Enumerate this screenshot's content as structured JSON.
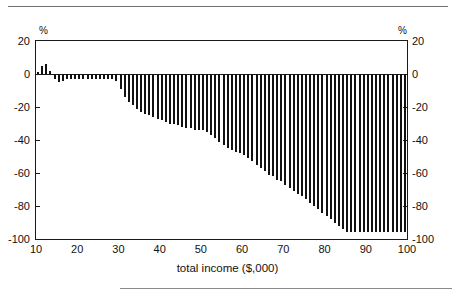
{
  "page": {
    "header_text": "",
    "background": "#ffffff",
    "ink": "#111111"
  },
  "axes": {
    "y_unit_label": "%",
    "y_ticks": [
      20,
      0,
      -20,
      -40,
      -60,
      -80,
      -100
    ],
    "y_tick_labels": [
      "20",
      "0",
      "-20",
      "-40",
      "-60",
      "-80",
      "-100"
    ],
    "x_ticks": [
      10,
      20,
      30,
      40,
      50,
      60,
      70,
      80,
      90,
      100
    ],
    "x_tick_labels": [
      "10",
      "20",
      "30",
      "40",
      "50",
      "60",
      "70",
      "80",
      "90",
      "100"
    ],
    "x_title": "total income ($,000)"
  },
  "chart_data": {
    "type": "bar",
    "title": "",
    "xlabel": "total income ($,000)",
    "ylabel": "%",
    "xlim": [
      10,
      100
    ],
    "ylim": [
      -100,
      20
    ],
    "grid": false,
    "legend": null,
    "bar_color": "#111111",
    "x": [
      10.5,
      11.5,
      12.5,
      13.5,
      14.5,
      15.5,
      16.5,
      17.5,
      18.5,
      19.5,
      20.5,
      21.5,
      22.5,
      23.5,
      24.5,
      25.5,
      26.5,
      27.5,
      28.5,
      29.5,
      30.5,
      31.5,
      32.5,
      33.5,
      34.5,
      35.5,
      36.5,
      37.5,
      38.5,
      39.5,
      40.5,
      41.5,
      42.5,
      43.5,
      44.5,
      45.5,
      46.5,
      47.5,
      48.5,
      49.5,
      50.5,
      51.5,
      52.5,
      53.5,
      54.5,
      55.5,
      56.5,
      57.5,
      58.5,
      59.5,
      60.5,
      61.5,
      62.5,
      63.5,
      64.5,
      65.5,
      66.5,
      67.5,
      68.5,
      69.5,
      70.5,
      71.5,
      72.5,
      73.5,
      74.5,
      75.5,
      76.5,
      77.5,
      78.5,
      79.5,
      80.5,
      81.5,
      82.5,
      83.5,
      84.5,
      85.5,
      86.5,
      87.5,
      88.5,
      89.5,
      90.5,
      91.5,
      92.5,
      93.5,
      94.5,
      95.5,
      96.5,
      97.5,
      98.5,
      99.5
    ],
    "values": [
      1,
      5,
      6,
      2,
      -3,
      -5,
      -4,
      -3,
      -3,
      -3,
      -3,
      -3,
      -3,
      -3,
      -3,
      -3,
      -3,
      -3,
      -3,
      -4,
      -9,
      -14,
      -17,
      -19,
      -21,
      -23,
      -24,
      -25,
      -26,
      -27,
      -28,
      -29,
      -30,
      -30,
      -31,
      -32,
      -33,
      -33,
      -34,
      -34,
      -34,
      -35,
      -37,
      -39,
      -41,
      -43,
      -45,
      -46,
      -47,
      -48,
      -49,
      -51,
      -53,
      -55,
      -57,
      -59,
      -61,
      -62,
      -64,
      -65,
      -67,
      -69,
      -71,
      -73,
      -74,
      -76,
      -78,
      -80,
      -82,
      -84,
      -86,
      -88,
      -90,
      -92,
      -94,
      -96,
      -96,
      -96,
      -96,
      -96,
      -96,
      -96,
      -96,
      -96,
      -96,
      -96,
      -96,
      -96,
      -96,
      -96
    ]
  }
}
